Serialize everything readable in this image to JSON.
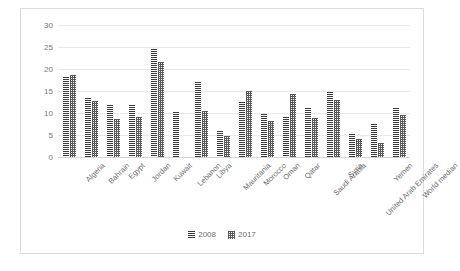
{
  "chart_data": {
    "type": "bar",
    "title": "",
    "xlabel": "",
    "ylabel": "",
    "ylim": [
      0,
      30
    ],
    "yticks": [
      0,
      5,
      10,
      15,
      20,
      25,
      30
    ],
    "grid": true,
    "legend_position": "bottom",
    "categories": [
      "Algeria",
      "Bahrain",
      "Egypt",
      "Jordan",
      "Kuwait",
      "Lebanon",
      "Libya",
      "Mauritania",
      "Morocco",
      "Oman",
      "Qatar",
      "Saudi Arabia",
      "Syria",
      "United Arab Emirates",
      "Yemen",
      "World median"
    ],
    "series": [
      {
        "name": "2008",
        "values": [
          18.2,
          13.4,
          11.9,
          11.9,
          24.5,
          10.2,
          17.0,
          5.8,
          12.4,
          9.8,
          9.0,
          11.1,
          14.7,
          5.2,
          7.4,
          11.2
        ]
      },
      {
        "name": "2017",
        "values": [
          18.7,
          12.8,
          8.7,
          9.1,
          21.6,
          0.0,
          10.4,
          4.8,
          15.0,
          8.2,
          14.3,
          8.8,
          12.9,
          4.2,
          3.1,
          9.5
        ]
      }
    ]
  },
  "legend": {
    "entries": [
      "2008",
      "2017"
    ]
  }
}
